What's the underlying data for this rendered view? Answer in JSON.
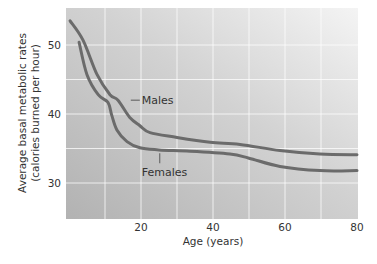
{
  "chart_data": {
    "type": "line",
    "title": "",
    "xlabel": "Age (years)",
    "ylabel_lines": [
      "Average basal metabolic rates",
      "(calories burned per hour)"
    ],
    "xlim": [
      0,
      80
    ],
    "ylim": [
      24.7,
      55.3
    ],
    "x_ticks": [
      20,
      40,
      60,
      80
    ],
    "y_ticks": [
      30,
      40,
      50
    ],
    "x_grid": [
      10,
      20,
      30,
      40,
      50,
      60,
      70
    ],
    "y_grid": [
      30,
      35,
      40,
      45,
      50
    ],
    "grid": true,
    "legend": "inline-labels",
    "series": [
      {
        "name": "Males",
        "x": [
          0.3,
          3.9,
          7.8,
          11.4,
          13.6,
          16.9,
          19.7,
          22.5,
          30,
          39.2,
          47.5,
          58.6,
          69.7,
          80
        ],
        "values": [
          53.5,
          50.7,
          45.7,
          42.8,
          42.0,
          39.5,
          38.3,
          37.3,
          36.6,
          35.9,
          35.6,
          34.7,
          34.2,
          34.1
        ],
        "label_anchor": [
          18,
          42
        ]
      },
      {
        "name": "Females",
        "x": [
          2.8,
          5,
          8.1,
          10.8,
          11.9,
          13.3,
          16.1,
          19.7,
          25,
          33.6,
          44.7,
          50,
          58.6,
          69.7,
          80
        ],
        "values": [
          50.4,
          45.7,
          42.8,
          41.7,
          39.8,
          37.7,
          36.0,
          35.1,
          34.8,
          34.6,
          34.2,
          33.6,
          32.4,
          31.8,
          31.8
        ],
        "label_anchor": [
          25.2,
          34.6
        ]
      }
    ],
    "colors": {
      "curve": "#6b6b6b",
      "background_dark": "#b2b2b2",
      "background_light": "#f4f4f4",
      "gridline": "#ffffff"
    }
  }
}
